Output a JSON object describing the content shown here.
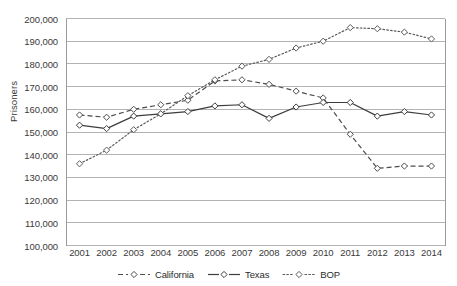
{
  "chart_data": {
    "type": "line",
    "title": "",
    "xlabel": "",
    "ylabel": "Prisoners",
    "x": [
      2001,
      2002,
      2003,
      2004,
      2005,
      2006,
      2007,
      2008,
      2009,
      2010,
      2011,
      2012,
      2013,
      2014
    ],
    "categories": [
      "2001",
      "2002",
      "2003",
      "2004",
      "2005",
      "2006",
      "2007",
      "2008",
      "2009",
      "2010",
      "2011",
      "2012",
      "2013",
      "2014"
    ],
    "ylim": [
      100000,
      200000
    ],
    "ytick_step": 10000,
    "ytick_labels": [
      "100,000",
      "110,000",
      "120,000",
      "130,000",
      "140,000",
      "150,000",
      "160,000",
      "170,000",
      "180,000",
      "190,000",
      "200,000"
    ],
    "ytick_values": [
      100000,
      110000,
      120000,
      130000,
      140000,
      150000,
      160000,
      170000,
      180000,
      190000,
      200000
    ],
    "grid": true,
    "grid_axis": "y",
    "grid_color": "#b3b3b3",
    "legend_position": "bottom",
    "series": [
      {
        "name": "California",
        "style": "dashed",
        "marker": "diamond-open",
        "color": "#4d4d4d",
        "values": [
          157500,
          156500,
          160000,
          162000,
          164000,
          172500,
          173000,
          171000,
          168000,
          165000,
          149000,
          134000,
          135000,
          135000
        ]
      },
      {
        "name": "Texas",
        "style": "solid",
        "marker": "diamond-open",
        "color": "#3d3d3d",
        "values": [
          153000,
          151500,
          157000,
          158000,
          159000,
          161500,
          162000,
          156000,
          161000,
          163000,
          163000,
          157000,
          159000,
          157500
        ]
      },
      {
        "name": "BOP",
        "style": "dotted",
        "marker": "diamond-open",
        "color": "#5a5a5a",
        "values": [
          136000,
          142000,
          151000,
          158000,
          166000,
          173000,
          179000,
          182000,
          187000,
          190000,
          196000,
          195500,
          194000,
          191000
        ]
      }
    ]
  },
  "legend": {
    "entries": [
      {
        "label": "California",
        "icon": "dashed-line-with-diamond-marker"
      },
      {
        "label": "Texas",
        "icon": "solid-line-with-diamond-marker"
      },
      {
        "label": "BOP",
        "icon": "dotted-line-with-diamond-marker"
      }
    ]
  },
  "axes": {
    "y_title": "Prisoners"
  },
  "colors": {
    "plot_border": "#9a9a9a",
    "gridline": "#b3b3b3",
    "text": "#2b2b2b",
    "background": "#ffffff"
  }
}
